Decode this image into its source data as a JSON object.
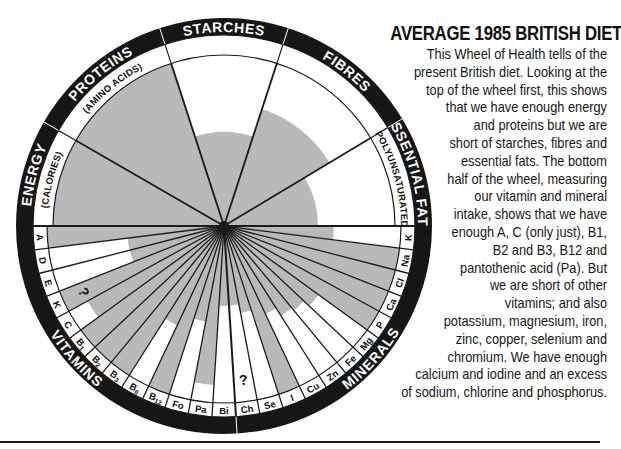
{
  "title": "AVERAGE 1985 BRITISH DIET",
  "description_lines": [
    "This Wheel of Health tells of the",
    "present British diet. Looking at the",
    "top of the wheel first, this shows",
    "that we have enough energy",
    "and proteins but we are",
    "short of starches, fibres and",
    "essential fats. The bottom",
    "half of the wheel, measuring",
    "our vitamin and mineral",
    "intake, shows that we have",
    "enough A, C (only just), B1,",
    "B2 and B3, B12 and",
    "pantothenic acid (Pa). But",
    "we are short of other",
    "vitamins; and also",
    "potassium, magnesium, iron,",
    "zinc, copper, selenium and",
    "chromium. We have enough",
    "calcium and iodine and an excess",
    "of sodium, chlorine and phosphorus."
  ],
  "colors": {
    "ring": "#161616",
    "shade": "#b9b9b9",
    "line": "#1a1a1a",
    "paper": "#ffffff"
  },
  "wheel": {
    "center": [
      224,
      226
    ],
    "outer_radius": 208,
    "ring_inner_radius": 191,
    "label_ring_inner_radius": 177,
    "top_segments": [
      {
        "id": "energy",
        "label": "ENERGY",
        "sublabel": "(CALORIES)",
        "start_deg": 180,
        "end_deg": 150,
        "shade": 1.0
      },
      {
        "id": "proteins",
        "label": "PROTEINS",
        "sublabel": "(AMINO ACIDS)",
        "start_deg": 150,
        "end_deg": 108,
        "shade": 1.0
      },
      {
        "id": "starches",
        "label": "STARCHES",
        "sublabel": "",
        "start_deg": 108,
        "end_deg": 72,
        "shade": 0.55
      },
      {
        "id": "fibres",
        "label": "FIBRES",
        "sublabel": "",
        "start_deg": 72,
        "end_deg": 31,
        "shade": 0.72
      },
      {
        "id": "essential-fats",
        "label": "ESSENTIAL FATS",
        "sublabel": "(POLYUNSATURATED)",
        "start_deg": 31,
        "end_deg": 0,
        "shade": 0.55
      }
    ],
    "group_labels": {
      "vitamins": "VITAMINS",
      "minerals": "MINERALS"
    },
    "bottom_segments": [
      {
        "label": "A",
        "group": "vitamins",
        "shade": 1.0,
        "mark": ""
      },
      {
        "label": "D",
        "group": "vitamins",
        "shade": 0.55,
        "mark": ""
      },
      {
        "label": "E",
        "group": "vitamins",
        "shade": 0.55,
        "mark": ""
      },
      {
        "label": "K",
        "group": "vitamins",
        "shade": 1.0,
        "mark": "?"
      },
      {
        "label": "C",
        "group": "vitamins",
        "shade": 0.88,
        "mark": ""
      },
      {
        "label": "B1",
        "group": "vitamins",
        "shade": 1.0,
        "mark": ""
      },
      {
        "label": "B2",
        "group": "vitamins",
        "shade": 1.0,
        "mark": ""
      },
      {
        "label": "B3",
        "group": "vitamins",
        "shade": 1.0,
        "mark": ""
      },
      {
        "label": "B6",
        "group": "vitamins",
        "shade": 0.62,
        "mark": ""
      },
      {
        "label": "B12",
        "group": "vitamins",
        "shade": 1.0,
        "mark": ""
      },
      {
        "label": "Fo",
        "group": "vitamins",
        "shade": 0.55,
        "mark": ""
      },
      {
        "label": "Pa",
        "group": "vitamins",
        "shade": 0.9,
        "mark": ""
      },
      {
        "label": "Bi",
        "group": "vitamins",
        "shade": 0.45,
        "mark": ""
      },
      {
        "label": "Ch",
        "group": "minerals",
        "shade": 0.45,
        "mark": "?"
      },
      {
        "label": "Se",
        "group": "minerals",
        "shade": 0.5,
        "mark": ""
      },
      {
        "label": "I",
        "group": "minerals",
        "shade": 1.0,
        "mark": ""
      },
      {
        "label": "Cu",
        "group": "minerals",
        "shade": 0.55,
        "mark": ""
      },
      {
        "label": "Zn",
        "group": "minerals",
        "shade": 0.6,
        "mark": ""
      },
      {
        "label": "Fe",
        "group": "minerals",
        "shade": 0.62,
        "mark": ""
      },
      {
        "label": "Mg",
        "group": "minerals",
        "shade": 0.66,
        "mark": ""
      },
      {
        "label": "P",
        "group": "minerals",
        "shade": 1.0,
        "mark": ""
      },
      {
        "label": "Ca",
        "group": "minerals",
        "shade": 1.0,
        "mark": ""
      },
      {
        "label": "Cl",
        "group": "minerals",
        "shade": 1.0,
        "mark": ""
      },
      {
        "label": "Na",
        "group": "minerals",
        "shade": 1.0,
        "mark": ""
      },
      {
        "label": "K",
        "group": "minerals",
        "shade": 0.62,
        "mark": ""
      }
    ],
    "base_shade_radius": 0.45
  }
}
